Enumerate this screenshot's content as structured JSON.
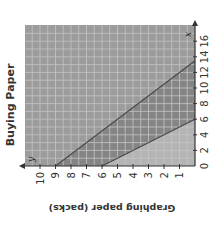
{
  "chart_data": {
    "type": "area",
    "title": "Buying Paper",
    "xlabel": "",
    "ylabel": "Graphing paper (packs)",
    "x_axis_variable": "x",
    "y_axis_variable": "y",
    "xlim": [
      0,
      17
    ],
    "ylim": [
      0,
      10.5
    ],
    "x_ticks": [
      0,
      2,
      4,
      6,
      8,
      10,
      12,
      14,
      16
    ],
    "y_ticks": [
      0,
      1,
      2,
      3,
      4,
      5,
      6,
      7,
      8,
      9,
      10
    ],
    "grid": true,
    "orientation": "rotated 90° counterclockwise",
    "series": [
      {
        "name": "upper boundary",
        "equation": "y = 9 - (2/3)x",
        "points": [
          [
            0,
            9
          ],
          [
            13.5,
            0
          ]
        ]
      },
      {
        "name": "lower boundary",
        "equation": "y = 6 - x",
        "points": [
          [
            0,
            6
          ],
          [
            6,
            0
          ]
        ]
      }
    ],
    "shaded_region": "between the two lines (darker band)",
    "colors": {
      "background_upper": "#9c9c9c",
      "band": "#858585",
      "below_lower": "#b4b4b4",
      "grid": "#c4c4c4",
      "lines": "#4a4a4a"
    }
  },
  "labels": {
    "title": "Buying Paper",
    "y_axis": "Graphing paper (packs)",
    "x_var": "x",
    "y_var": "y",
    "x_ticks": [
      "0",
      "2",
      "4",
      "6",
      "8",
      "10",
      "12",
      "14",
      "16"
    ],
    "y_ticks": [
      "1",
      "2",
      "3",
      "4",
      "5",
      "6",
      "7",
      "8",
      "9",
      "10"
    ]
  }
}
